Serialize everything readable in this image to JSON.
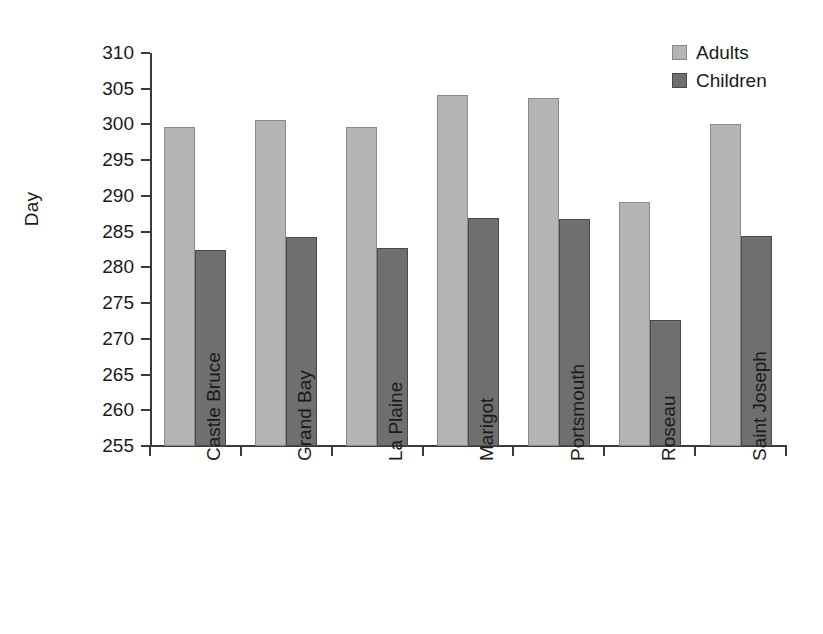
{
  "chart_data": {
    "type": "bar",
    "title": "",
    "subtitle": "",
    "xlabel": "",
    "ylabel": "Day",
    "categories": [
      "Castle Bruce",
      "Grand Bay",
      "La Plaine",
      "Marigot",
      "Portsmouth",
      "Roseau",
      "Saint Joseph"
    ],
    "series": [
      {
        "name": "Adults",
        "color": "#b4b4b4",
        "values": [
          299.7,
          300.6,
          299.7,
          304.1,
          303.7,
          289.1,
          300.1
        ]
      },
      {
        "name": "Children",
        "color": "#6f6f6f",
        "values": [
          282.5,
          284.3,
          282.7,
          286.9,
          286.8,
          272.6,
          284.4
        ]
      }
    ],
    "ylim": [
      255,
      310
    ],
    "yticks": [
      255,
      260,
      265,
      270,
      275,
      280,
      285,
      290,
      295,
      300,
      305,
      310
    ],
    "ytick_labels": [
      "255",
      "260",
      "265",
      "270",
      "275",
      "280",
      "285",
      "290",
      "295",
      "300",
      "305",
      "310"
    ],
    "grid": false,
    "legend_position": "top-right",
    "legend_entries": [
      "Adults",
      "Children"
    ]
  }
}
